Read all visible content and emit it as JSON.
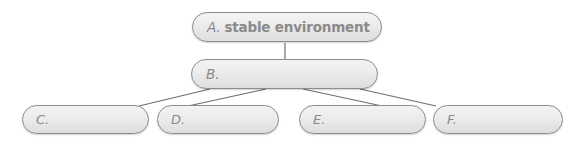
{
  "diagram": {
    "type": "hierarchy-tree",
    "orientation": "top-down",
    "levels": 3,
    "background_color": "#ffffff",
    "node_fill_color": "#ececec",
    "node_border_color": "#8d8d8d",
    "text_color": "#8a8a8a",
    "connector_color": "#6e6e6e",
    "nodes": [
      {
        "id": "A",
        "letter": "A.",
        "phrase": "stable environment",
        "label": "A. stable environment",
        "level": 1,
        "blank": false
      },
      {
        "id": "B",
        "letter": "B.",
        "phrase": "",
        "label": "B.",
        "level": 2,
        "blank": true
      },
      {
        "id": "C",
        "letter": "C.",
        "phrase": "",
        "label": "C.",
        "level": 3,
        "blank": true
      },
      {
        "id": "D",
        "letter": "D.",
        "phrase": "",
        "label": "D.",
        "level": 3,
        "blank": true
      },
      {
        "id": "E",
        "letter": "E.",
        "phrase": "",
        "label": "E.",
        "level": 3,
        "blank": true
      },
      {
        "id": "F",
        "letter": "F.",
        "phrase": "",
        "label": "F.",
        "level": 3,
        "blank": true
      }
    ],
    "edges": [
      {
        "from": "A",
        "to": "B"
      },
      {
        "from": "B",
        "to": "C"
      },
      {
        "from": "B",
        "to": "D"
      },
      {
        "from": "B",
        "to": "E"
      },
      {
        "from": "B",
        "to": "F"
      }
    ]
  }
}
